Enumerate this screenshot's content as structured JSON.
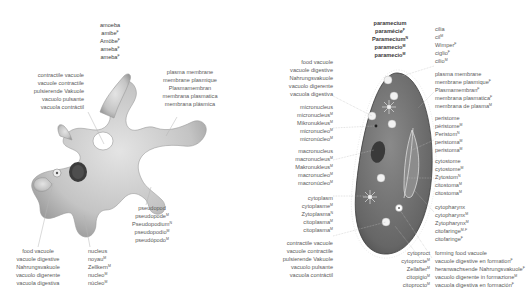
{
  "amoeba": {
    "title": [
      "amoeba",
      "amibe",
      "Amöbe",
      "ameba",
      "ameba"
    ],
    "title_genders": [
      "",
      "F",
      "F",
      "F",
      "F"
    ],
    "labels": {
      "contractile_vacuole": {
        "lines": [
          "contractile vacuole",
          "vacuole contractile",
          "pulsierende Vakuole",
          "vacuolo pulsante",
          "vacuola contráctil"
        ],
        "genders": [
          "",
          "F",
          "F",
          "M",
          "F"
        ]
      },
      "plasma_membrane": {
        "lines": [
          "plasma membrane",
          "membrane plasmique",
          "Plasmamembran",
          "membrana plasmatica",
          "membrana plásmica"
        ],
        "genders": [
          "",
          "F",
          "F",
          "F",
          "F"
        ]
      },
      "pseudopod": {
        "lines": [
          "pseudopod",
          "pseudopode",
          "Pseudopodium",
          "pseudopodio",
          "pseudópodo"
        ],
        "genders": [
          "",
          "M",
          "N",
          "M",
          "M"
        ]
      },
      "food_vacuole": {
        "lines": [
          "food vacuole",
          "vacuole digestive",
          "Nahrungsvakuole",
          "vacuolo digerente",
          "vacuola digestiva"
        ],
        "genders": [
          "",
          "F",
          "F",
          "M",
          "F"
        ]
      },
      "nucleus": {
        "lines": [
          "nucleus",
          "noyau",
          "Zellkern",
          "nucleo",
          "núcleo"
        ],
        "genders": [
          "",
          "M",
          "M",
          "M",
          "M"
        ]
      }
    }
  },
  "paramecium": {
    "title": [
      "paramecium",
      "paramécie",
      "Paramecium",
      "paramecio",
      "paramecio"
    ],
    "title_genders": [
      "",
      "F",
      "N",
      "M",
      "M"
    ],
    "labels": {
      "cilia": {
        "lines": [
          "cilia",
          "cil",
          "Wimper",
          "ciglio",
          "cilio"
        ],
        "genders": [
          "",
          "M",
          "F",
          "F",
          "M"
        ]
      },
      "plasma_membrane": {
        "lines": [
          "plasma membrane",
          "membrane plasmique",
          "Plasmamembran",
          "membrana plasmatica",
          "membrana de plasma"
        ],
        "genders": [
          "",
          "F",
          "F",
          "F",
          "M"
        ]
      },
      "peristome": {
        "lines": [
          "peristome",
          "péristome",
          "Peristom",
          "peristoma",
          "peristoma"
        ],
        "genders": [
          "",
          "M",
          "N",
          "M",
          "M"
        ]
      },
      "cytostome": {
        "lines": [
          "cytostome",
          "cytostome",
          "Zytostom",
          "citostoma",
          "citostoma"
        ],
        "genders": [
          "",
          "M",
          "N",
          "M",
          "M"
        ]
      },
      "cytopharynx": {
        "lines": [
          "cytopharynx",
          "cytopharynx",
          "Zytopharynx",
          "citofaringe",
          "citofaringe"
        ],
        "genders": [
          "",
          "M",
          "M",
          "M-F",
          "F"
        ]
      },
      "forming_food_vacuole": {
        "lines": [
          "forming food vacuole",
          "vacuole digestive en formation",
          "heranwachsende Nahrungsvakuole",
          "vacuolo digerente in formazione",
          "vacuola digestiva en formación"
        ],
        "genders": [
          "",
          "F",
          "F",
          "M",
          "F"
        ]
      },
      "cytoproct": {
        "lines": [
          "cytoproct",
          "cytoprocte",
          "Zellafter",
          "citopigio",
          "citoprocto"
        ],
        "genders": [
          "",
          "M",
          "M",
          "M",
          "M"
        ]
      },
      "food_vacuole": {
        "lines": [
          "food vacuole",
          "vacuole digestive",
          "Nahrungsvakuole",
          "vacuolo digerente",
          "vacuola digestiva"
        ],
        "genders": [
          "",
          "F",
          "F",
          "M",
          "F"
        ]
      },
      "micronucleus": {
        "lines": [
          "micronucleus",
          "micronucleus",
          "Mikronukleus",
          "micronucleo",
          "micronúcleo"
        ],
        "genders": [
          "",
          "M",
          "M",
          "M",
          "M"
        ]
      },
      "macronucleus": {
        "lines": [
          "macronucleus",
          "macronucleus",
          "Makronukleus",
          "macronucleo",
          "macronúcleo"
        ],
        "genders": [
          "",
          "M",
          "M",
          "M",
          "M"
        ]
      },
      "cytoplasm": {
        "lines": [
          "cytoplasm",
          "cytoplasme",
          "Zytoplasma",
          "citoplasma",
          "citoplasma"
        ],
        "genders": [
          "",
          "M",
          "N",
          "M",
          "M"
        ]
      },
      "contractile_vacuole": {
        "lines": [
          "contractile vacuole",
          "vacuole contractile",
          "pulsierende Vakuole",
          "vacuolo pulsante",
          "vacuola contráctil"
        ],
        "genders": [
          "",
          "F",
          "F",
          "M",
          "F"
        ]
      }
    }
  },
  "colors": {
    "text": "#5a5a5a",
    "title_text": "#3a3a3a",
    "amoeba_body": "#c9c9c9",
    "amoeba_shadow": "#9a9a9a",
    "paramecium_body": "#6e6e6e",
    "nucleus": "#3c3c3c",
    "leader_line": "#b0b0b0"
  }
}
